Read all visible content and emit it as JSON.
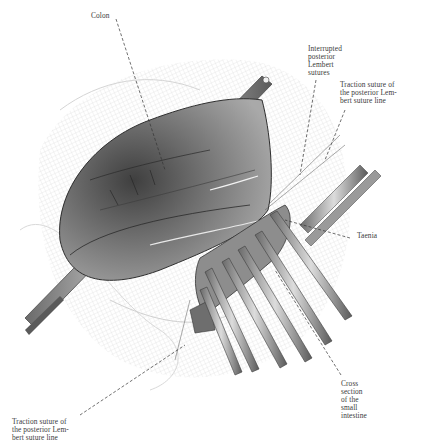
{
  "figure": {
    "colors": {
      "background": "#ffffff",
      "ink": "#3a3a3a",
      "tissue_dark": "#4a4a4a",
      "tissue_mid": "#8a8a8a",
      "tissue_light": "#c8c8c8",
      "clamp": "#bdbdbd"
    }
  },
  "labels": {
    "colon": "Colon",
    "interrupted": "Interrupted\nposterior\nLembert\nsutures",
    "traction_top": "Traction suture of\nthe posterior Lem-\nbert suture line",
    "taenia": "Taenia",
    "cross_section": "Cross\nsection\nof the\nsmall\nintestine",
    "traction_bottom": "Traction suture of\nthe posterior Lem-\nbert suture line"
  }
}
